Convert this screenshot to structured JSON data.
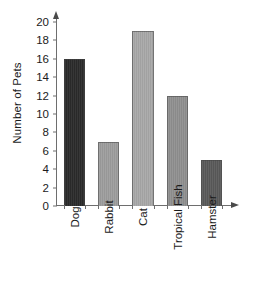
{
  "chart_data": {
    "type": "bar",
    "title": "",
    "xlabel": "",
    "ylabel": "Number of Pets",
    "categories": [
      "Dog",
      "Rabbit",
      "Cat",
      "Tropical Fish",
      "Hamster"
    ],
    "values": [
      16,
      7,
      19,
      12,
      5
    ],
    "bar_colors": [
      "#2b2b2b",
      "#9e9e9e",
      "#a8a8a8",
      "#909090",
      "#5a5a5a"
    ],
    "ylim": [
      0,
      20
    ],
    "ytick_values": [
      0,
      2,
      4,
      6,
      8,
      10,
      12,
      14,
      16,
      18,
      20
    ],
    "ytick_labels": [
      "0",
      "2",
      "4",
      "6",
      "8",
      "10",
      "12",
      "14",
      "16",
      "18",
      "20"
    ],
    "grid": false,
    "legend": "none",
    "axis_color": "#6e6e6e",
    "text_color": "#1b1b1b",
    "background": "#ffffff"
  }
}
